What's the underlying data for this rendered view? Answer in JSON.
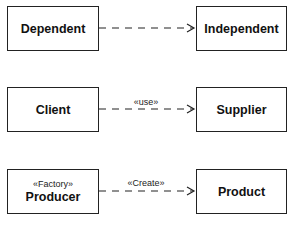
{
  "diagram": {
    "type": "UML dependency relationships",
    "rows": [
      {
        "source": {
          "name": "Dependent",
          "stereotype": ""
        },
        "target": {
          "name": "Independent"
        },
        "label": ""
      },
      {
        "source": {
          "name": "Client",
          "stereotype": ""
        },
        "target": {
          "name": "Supplier"
        },
        "label": "«use»"
      },
      {
        "source": {
          "name": "Producer",
          "stereotype": "«Factory»"
        },
        "target": {
          "name": "Product"
        },
        "label": "«Create»"
      }
    ],
    "colors": {
      "stroke": "#222222",
      "background": "#ffffff"
    }
  }
}
